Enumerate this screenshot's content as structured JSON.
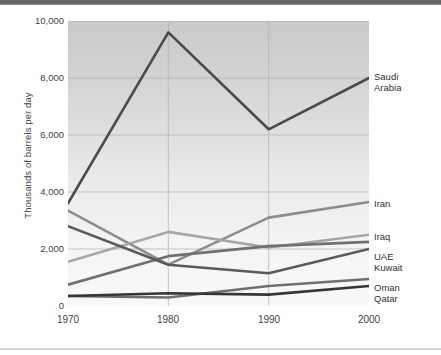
{
  "figure": {
    "top_rule_color": "#5e5e5e",
    "bottom_rule_color": "#d7d7d7",
    "plot_bg_top": "#c9c9c9",
    "plot_bg_bottom": "#f8f8f8"
  },
  "chart_data": {
    "type": "line",
    "title": "",
    "subtitle": "",
    "xlabel": "",
    "ylabel": "Thousands of barrels per day",
    "x": [
      1970,
      1980,
      1990,
      2000
    ],
    "xtick_labels": [
      "1970",
      "1980",
      "1990",
      "2000"
    ],
    "xlim": [
      1970,
      2000
    ],
    "ylim": [
      0,
      10000
    ],
    "ytick_labels": [
      "0",
      "2,000",
      "4,000",
      "6,000",
      "8,000",
      "10,000"
    ],
    "yticks": [
      0,
      2000,
      4000,
      6000,
      8000,
      10000
    ],
    "grid": "horizontal-and-vertical",
    "legend_position": "right-inline-labels",
    "series": [
      {
        "name": "Saudi Arabia",
        "label": "Saudi\nArabia",
        "color": "#4a4a4a",
        "values": [
          3600,
          9600,
          6200,
          8000
        ]
      },
      {
        "name": "Iran",
        "label": "Iran",
        "color": "#8c8c8c",
        "values": [
          3350,
          1450,
          3100,
          3650
        ]
      },
      {
        "name": "Iraq",
        "label": "Iraq",
        "color": "#a6a6a6",
        "values": [
          1550,
          2600,
          2050,
          2500
        ]
      },
      {
        "name": "UAE",
        "label": "UAE",
        "color": "#707070",
        "values": [
          750,
          1750,
          2100,
          2250
        ]
      },
      {
        "name": "Kuwait",
        "label": "Kuwait",
        "color": "#5a5a5a",
        "values": [
          2800,
          1450,
          1150,
          2000
        ]
      },
      {
        "name": "Oman",
        "label": "Oman",
        "color": "#6f6f6f",
        "values": [
          350,
          300,
          700,
          950
        ]
      },
      {
        "name": "Qatar",
        "label": "Qatar",
        "color": "#353535",
        "values": [
          350,
          450,
          400,
          700
        ]
      }
    ]
  }
}
